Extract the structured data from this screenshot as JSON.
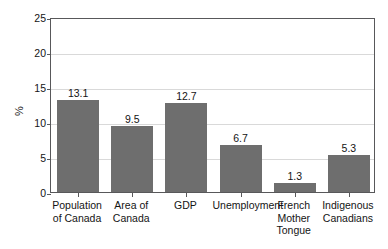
{
  "chart_data": {
    "type": "bar",
    "title": "",
    "subtitle": "",
    "xlabel": "",
    "ylabel": "%",
    "ylim": [
      0,
      25
    ],
    "yticks": [
      0,
      5,
      10,
      15,
      20,
      25
    ],
    "ytick_labels": [
      "0",
      "5",
      "10",
      "15",
      "20",
      "25"
    ],
    "grid": true,
    "legend": false,
    "legend_position": "none",
    "categories": [
      "Population of Canada",
      "Area of Canada",
      "GDP",
      "Unemployment",
      "French Mother Tongue",
      "Indigenous Canadians"
    ],
    "category_lines": [
      [
        "Population",
        "of Canada"
      ],
      [
        "Area of",
        "Canada"
      ],
      [
        "GDP"
      ],
      [
        "Unemployment"
      ],
      [
        "French",
        "Mother",
        "Tongue"
      ],
      [
        "Indigenous",
        "Canadians"
      ]
    ],
    "values": [
      13.1,
      9.5,
      12.7,
      6.7,
      1.3,
      5.3
    ],
    "value_labels": [
      "13.1",
      "9.5",
      "12.7",
      "6.7",
      "1.3",
      "5.3"
    ],
    "bar_color": "#6e6e6e",
    "gridline_color": "#d9d9d9",
    "axis_color": "#58585a",
    "background_color": "#ffffff",
    "text_color": "#141414"
  }
}
